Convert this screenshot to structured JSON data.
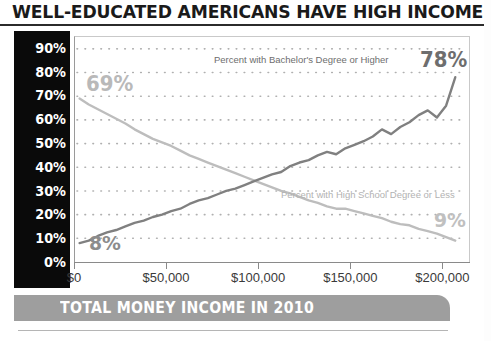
{
  "title": "WELL-EDUCATED AMERICANS HAVE HIGH INCOMES",
  "footer_banner": "TOTAL MONEY INCOME IN 2010",
  "colors": {
    "axis_band": "#0a0a0a",
    "bachelors_line": "#808080",
    "highschool_line": "#bdbdbd",
    "banner": "#9e9e9e",
    "grid_dot": "#b0b0b0"
  },
  "chart_data": {
    "type": "line",
    "title": "WELL-EDUCATED AMERICANS HAVE HIGH INCOMES",
    "subtitle": "TOTAL MONEY INCOME IN 2010",
    "xlabel": "TOTAL MONEY INCOME IN 2010",
    "ylabel": "",
    "xlim": [
      0,
      215000
    ],
    "ylim": [
      0,
      95
    ],
    "grid": "dotted-horizontal",
    "legend": "inline-annotations",
    "x_ticks": [
      {
        "value": 0,
        "label": "$0"
      },
      {
        "value": 50000,
        "label": "$50,000"
      },
      {
        "value": 100000,
        "label": "$100,000"
      },
      {
        "value": 150000,
        "label": "$150,000"
      },
      {
        "value": 200000,
        "label": "$200,000"
      }
    ],
    "y_ticks": [
      {
        "value": 90,
        "label": "90%"
      },
      {
        "value": 80,
        "label": "80%"
      },
      {
        "value": 70,
        "label": "70%"
      },
      {
        "value": 60,
        "label": "60%"
      },
      {
        "value": 50,
        "label": "50%"
      },
      {
        "value": 40,
        "label": "40%"
      },
      {
        "value": 30,
        "label": "30%"
      },
      {
        "value": 20,
        "label": "20%"
      },
      {
        "value": 10,
        "label": "10%"
      },
      {
        "value": 0,
        "label": "0%"
      }
    ],
    "series": [
      {
        "name": "Percent with Bachelor's Degree or Higher",
        "color": "#808080",
        "start_label": "8%",
        "end_label": "78%",
        "x": [
          2500,
          7500,
          12500,
          17500,
          22500,
          27500,
          32500,
          37500,
          42500,
          47500,
          52500,
          57500,
          62500,
          67500,
          72500,
          77500,
          82500,
          87500,
          92500,
          97500,
          102500,
          107500,
          112500,
          117500,
          122500,
          127500,
          132500,
          137500,
          142500,
          147500,
          152500,
          157500,
          162500,
          167500,
          172500,
          177500,
          182500,
          187500,
          192500,
          197500,
          202500,
          207500
        ],
        "y": [
          8,
          9,
          11,
          12.5,
          13.5,
          15,
          16.5,
          17.5,
          19,
          20,
          21.5,
          22.5,
          24.5,
          26,
          27,
          28.5,
          30,
          31,
          32.5,
          34,
          35.5,
          37,
          38,
          40.5,
          42,
          43,
          45,
          46.5,
          45.5,
          48,
          49.5,
          51,
          53,
          56,
          54,
          57,
          59,
          62,
          64,
          61,
          66,
          78
        ]
      },
      {
        "name": "Percent with High School Degree or Less",
        "color": "#bdbdbd",
        "start_label": "69%",
        "end_label": "9%",
        "x": [
          2500,
          7500,
          12500,
          17500,
          22500,
          27500,
          32500,
          37500,
          42500,
          47500,
          52500,
          57500,
          62500,
          67500,
          72500,
          77500,
          82500,
          87500,
          92500,
          97500,
          102500,
          107500,
          112500,
          117500,
          122500,
          127500,
          132500,
          137500,
          142500,
          147500,
          152500,
          157500,
          162500,
          167500,
          172500,
          177500,
          182500,
          187500,
          192500,
          197500,
          202500,
          207500
        ],
        "y": [
          69,
          66.5,
          64.5,
          62.5,
          60.5,
          58.5,
          56,
          54,
          52,
          50.5,
          49,
          47,
          45,
          43.5,
          42,
          40.5,
          39,
          37.5,
          36,
          34.5,
          33,
          31.5,
          30,
          29,
          27.5,
          26,
          25,
          23.5,
          22.5,
          22.5,
          21.5,
          20.5,
          19.5,
          18.5,
          17,
          16,
          15.5,
          14,
          13,
          12,
          10.5,
          9
        ]
      }
    ],
    "annotations": [
      {
        "text": "Percent with Bachelor's Degree or Higher",
        "series": "bachelors"
      },
      {
        "text": "Percent with High School Degree or Less",
        "series": "highschool"
      },
      {
        "text": "69%",
        "series": "highschool",
        "point": "start"
      },
      {
        "text": "8%",
        "series": "bachelors",
        "point": "start"
      },
      {
        "text": "78%",
        "series": "bachelors",
        "point": "end"
      },
      {
        "text": "9%",
        "series": "highschool",
        "point": "end"
      }
    ]
  }
}
